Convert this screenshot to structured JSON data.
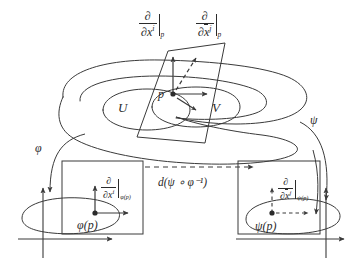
{
  "diagram": {
    "stroke_color": "#3a3a3a",
    "text_color": "#2b2b2b",
    "background": "#ffffff"
  },
  "manifold": {
    "set_u_label": "U",
    "set_v_label": "V",
    "point_label": "p"
  },
  "tangent_plane": {
    "basis_1": {
      "partial": "∂",
      "denominator_partial": "∂",
      "variable": "x",
      "superscript": "i",
      "evaluated_at": "p",
      "overbar": false
    },
    "basis_2": {
      "partial": "∂",
      "denominator_partial": "∂",
      "variable": "x",
      "superscript": "j",
      "evaluated_at": "p",
      "overbar": true
    }
  },
  "maps": {
    "phi_label": "φ",
    "psi_label": "ψ",
    "differential_label": "d(ψ ∘ φ⁻¹)"
  },
  "left_chart": {
    "point_label": "φ(p)",
    "basis": {
      "partial": "∂",
      "denominator_partial": "∂",
      "variable": "x",
      "superscript": "i",
      "evaluated_at": "φ(p)",
      "overbar": false
    }
  },
  "right_chart": {
    "point_label": "ψ(p)",
    "basis": {
      "partial": "∂",
      "denominator_partial": "∂",
      "variable": "x",
      "superscript": "j",
      "evaluated_at": "ψ(p)",
      "overbar": true
    }
  }
}
